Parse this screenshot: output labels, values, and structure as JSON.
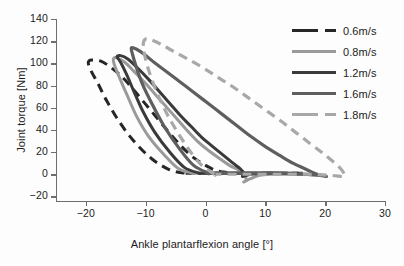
{
  "chart_data": {
    "type": "line",
    "title": "",
    "xlabel": "Ankle plantarflexion angle [°]",
    "ylabel": "Joint torque [Nm]",
    "xlim": [
      -25,
      30
    ],
    "ylim": [
      -25,
      140
    ],
    "xticks": [
      -20,
      -10,
      0,
      10,
      20,
      30
    ],
    "xticklabels": [
      "−20",
      "−10",
      "0",
      "10",
      "20",
      "30"
    ],
    "yticks": [
      -20,
      0,
      20,
      40,
      60,
      80,
      100,
      120,
      140
    ],
    "yticklabels": [
      "−20",
      "0",
      "20",
      "40",
      "60",
      "80",
      "100",
      "120",
      "140"
    ],
    "grid": false,
    "legend_position": "upper-right",
    "series": [
      {
        "name": "0.6m/s",
        "color": "#262626",
        "style": "dashed",
        "width": 3.0,
        "points": [
          [
            -3.5,
            1
          ],
          [
            -6.0,
            4
          ],
          [
            -9.0,
            14
          ],
          [
            -12.0,
            30
          ],
          [
            -14.5,
            48
          ],
          [
            -16.5,
            66
          ],
          [
            -18.0,
            82
          ],
          [
            -19.2,
            94
          ],
          [
            -19.6,
            101
          ],
          [
            -19.0,
            103
          ],
          [
            -17.5,
            102
          ],
          [
            -16.0,
            97
          ],
          [
            -14.0,
            88
          ],
          [
            -12.0,
            76
          ],
          [
            -10.0,
            63
          ],
          [
            -8.0,
            50
          ],
          [
            -6.0,
            37
          ],
          [
            -4.0,
            25
          ],
          [
            -2.0,
            15
          ],
          [
            0.0,
            8
          ],
          [
            1.5,
            4
          ],
          [
            3.0,
            2
          ],
          [
            4.5,
            1
          ],
          [
            6.0,
            1
          ],
          [
            7.5,
            1
          ],
          [
            9.0,
            1
          ],
          [
            11.0,
            1
          ],
          [
            13.0,
            1
          ],
          [
            15.0,
            1
          ],
          [
            16.5,
            1
          ],
          [
            15.0,
            1
          ],
          [
            12.0,
            1
          ],
          [
            8.0,
            1
          ],
          [
            4.0,
            1
          ],
          [
            0.0,
            1
          ],
          [
            -3.5,
            1
          ]
        ]
      },
      {
        "name": "0.8m/s",
        "color": "#9a9a9a",
        "style": "solid",
        "width": 3.0,
        "points": [
          [
            -2.0,
            1
          ],
          [
            -4.5,
            5
          ],
          [
            -7.0,
            18
          ],
          [
            -9.5,
            34
          ],
          [
            -11.5,
            52
          ],
          [
            -13.0,
            70
          ],
          [
            -14.3,
            86
          ],
          [
            -15.2,
            98
          ],
          [
            -15.4,
            104
          ],
          [
            -14.8,
            105
          ],
          [
            -13.5,
            101
          ],
          [
            -12.0,
            93
          ],
          [
            -10.2,
            83
          ],
          [
            -8.4,
            72
          ],
          [
            -6.6,
            61
          ],
          [
            -4.8,
            50
          ],
          [
            -3.0,
            39
          ],
          [
            -1.2,
            29
          ],
          [
            0.6,
            21
          ],
          [
            2.4,
            14
          ],
          [
            4.0,
            8
          ],
          [
            5.5,
            4
          ],
          [
            6.5,
            0
          ],
          [
            6.8,
            -5
          ],
          [
            6.4,
            -7
          ],
          [
            7.5,
            -4
          ],
          [
            9.0,
            -1
          ],
          [
            11.0,
            0
          ],
          [
            13.0,
            0
          ],
          [
            15.0,
            0
          ],
          [
            17.0,
            0
          ],
          [
            18.5,
            0
          ],
          [
            17.0,
            0
          ],
          [
            13.0,
            1
          ],
          [
            8.0,
            1
          ],
          [
            3.0,
            1
          ],
          [
            -2.0,
            1
          ]
        ]
      },
      {
        "name": "1.2m/s",
        "color": "#3a3a3a",
        "style": "solid",
        "width": 3.0,
        "points": [
          [
            -1.0,
            1
          ],
          [
            -3.5,
            6
          ],
          [
            -6.0,
            20
          ],
          [
            -8.5,
            38
          ],
          [
            -10.5,
            57
          ],
          [
            -12.0,
            75
          ],
          [
            -13.2,
            90
          ],
          [
            -14.2,
            101
          ],
          [
            -14.8,
            106
          ],
          [
            -14.2,
            107
          ],
          [
            -13.0,
            104
          ],
          [
            -11.4,
            96
          ],
          [
            -9.6,
            86
          ],
          [
            -7.8,
            75
          ],
          [
            -6.0,
            64
          ],
          [
            -4.2,
            53
          ],
          [
            -2.4,
            43
          ],
          [
            -0.6,
            33
          ],
          [
            1.2,
            25
          ],
          [
            3.0,
            17
          ],
          [
            4.6,
            10
          ],
          [
            5.8,
            5
          ],
          [
            6.4,
            1
          ],
          [
            6.2,
            -2
          ],
          [
            7.5,
            0
          ],
          [
            9.5,
            1
          ],
          [
            12.0,
            1
          ],
          [
            14.0,
            1
          ],
          [
            15.5,
            1
          ],
          [
            14.0,
            1
          ],
          [
            10.0,
            1
          ],
          [
            6.0,
            1
          ],
          [
            2.0,
            1
          ],
          [
            -1.0,
            1
          ]
        ]
      },
      {
        "name": "1.6m/s",
        "color": "#5e5e5e",
        "style": "solid",
        "width": 3.2,
        "points": [
          [
            0.5,
            1
          ],
          [
            -2.0,
            8
          ],
          [
            -4.5,
            24
          ],
          [
            -7.0,
            44
          ],
          [
            -9.0,
            64
          ],
          [
            -10.6,
            82
          ],
          [
            -11.6,
            97
          ],
          [
            -12.2,
            108
          ],
          [
            -12.4,
            114
          ],
          [
            -11.6,
            113
          ],
          [
            -10.2,
            108
          ],
          [
            -8.4,
            100
          ],
          [
            -6.4,
            92
          ],
          [
            -4.2,
            83
          ],
          [
            -2.0,
            74
          ],
          [
            0.4,
            64
          ],
          [
            2.8,
            54
          ],
          [
            5.2,
            44
          ],
          [
            7.6,
            34
          ],
          [
            10.0,
            25
          ],
          [
            12.4,
            17
          ],
          [
            14.6,
            10
          ],
          [
            16.6,
            5
          ],
          [
            18.2,
            1
          ],
          [
            19.4,
            -1
          ],
          [
            20.2,
            -2
          ],
          [
            19.0,
            -1
          ],
          [
            16.0,
            0
          ],
          [
            12.0,
            1
          ],
          [
            8.0,
            1
          ],
          [
            4.0,
            1
          ],
          [
            0.5,
            1
          ]
        ]
      },
      {
        "name": "1.8m/s",
        "color": "#a8a8a8",
        "style": "dashed",
        "width": 3.2,
        "points": [
          [
            1.5,
            0
          ],
          [
            -1.0,
            10
          ],
          [
            -3.5,
            28
          ],
          [
            -6.0,
            50
          ],
          [
            -8.0,
            72
          ],
          [
            -9.4,
            92
          ],
          [
            -10.2,
            108
          ],
          [
            -10.4,
            118
          ],
          [
            -10.0,
            122
          ],
          [
            -9.0,
            121
          ],
          [
            -7.4,
            117
          ],
          [
            -5.4,
            111
          ],
          [
            -3.0,
            104
          ],
          [
            -0.4,
            96
          ],
          [
            2.2,
            87
          ],
          [
            4.8,
            78
          ],
          [
            7.4,
            68
          ],
          [
            10.0,
            58
          ],
          [
            12.6,
            48
          ],
          [
            15.0,
            38
          ],
          [
            17.4,
            28
          ],
          [
            19.6,
            19
          ],
          [
            21.4,
            11
          ],
          [
            22.6,
            5
          ],
          [
            23.2,
            0
          ],
          [
            23.0,
            -2
          ],
          [
            21.0,
            -1
          ],
          [
            17.0,
            0
          ],
          [
            12.0,
            0
          ],
          [
            7.0,
            0
          ],
          [
            3.0,
            0
          ],
          [
            1.5,
            0
          ]
        ]
      }
    ]
  },
  "axis": {
    "xlabel": "Ankle plantarflexion angle [°]",
    "ylabel": "Joint torque [Nm]"
  },
  "legend": {
    "items": [
      {
        "label": "0.6m/s"
      },
      {
        "label": "0.8m/s"
      },
      {
        "label": "1.2m/s"
      },
      {
        "label": "1.6m/s"
      },
      {
        "label": "1.8m/s"
      }
    ]
  }
}
